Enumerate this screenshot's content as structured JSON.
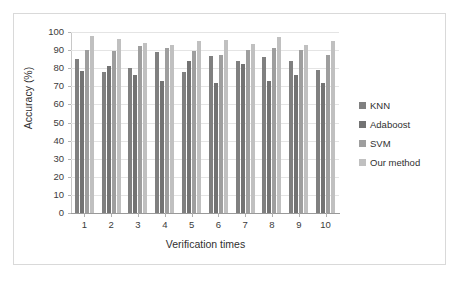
{
  "chart_data": {
    "type": "bar",
    "title": "",
    "xlabel": "Verification times",
    "ylabel": "Accuracy  (%)",
    "categories": [
      "1",
      "2",
      "3",
      "4",
      "5",
      "6",
      "7",
      "8",
      "9",
      "10"
    ],
    "ylim": [
      0,
      100
    ],
    "yticks": [
      0,
      10,
      20,
      30,
      40,
      50,
      60,
      70,
      80,
      90,
      100
    ],
    "grid": true,
    "legend_position": "right",
    "series": [
      {
        "name": "KNN",
        "color": "#808080",
        "values": [
          85,
          78,
          80,
          89,
          78,
          87,
          84,
          86,
          84,
          79
        ]
      },
      {
        "name": "Adaboost",
        "color": "#737373",
        "values": [
          78.5,
          81.5,
          76,
          73,
          84,
          72,
          82.5,
          73,
          76,
          72
        ]
      },
      {
        "name": "SVM",
        "color": "#9e9e9e",
        "values": [
          90,
          89.5,
          92,
          91,
          89.5,
          87.5,
          90,
          91,
          90,
          87.5
        ]
      },
      {
        "name": "Our method",
        "color": "#c0c0c0",
        "values": [
          98,
          96,
          94,
          93,
          95,
          95.5,
          93.5,
          97.5,
          93,
          95
        ]
      }
    ]
  },
  "legend": {
    "items": [
      {
        "label": "KNN"
      },
      {
        "label": "Adaboost"
      },
      {
        "label": "SVM"
      },
      {
        "label": "Our method"
      }
    ]
  }
}
